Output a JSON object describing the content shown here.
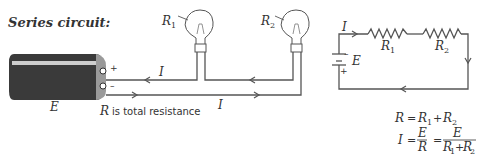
{
  "title": "Series circuit:",
  "pictorial": {
    "battery_label": "E",
    "plus_sign": "+",
    "minus_sign": "–",
    "current_top": "I",
    "current_bottom": "I",
    "bulb1": {
      "label": "R",
      "sub": "1"
    },
    "bulb2": {
      "label": "R",
      "sub": "2"
    },
    "caption_var": "R",
    "caption_text": "is total resistance"
  },
  "schematic": {
    "current_label": "I",
    "emf_label": "E",
    "minus_sign": "–",
    "plus_sign": "+",
    "resistor1": {
      "label": "R",
      "sub": "1"
    },
    "resistor2": {
      "label": "R",
      "sub": "2"
    }
  },
  "equations": {
    "eq1": {
      "lhs": "R",
      "eq": "=",
      "t1": "R",
      "s1": "1",
      "plus": "+",
      "t2": "R",
      "s2": "2"
    },
    "eq2": {
      "lhs": "I",
      "eq": "=",
      "num1": "E",
      "den1": "R",
      "eq2": "=",
      "num2": "E",
      "den_a": "R",
      "den_as": "1",
      "den_plus": "+",
      "den_b": "R",
      "den_bs": "2"
    }
  },
  "colors": {
    "ink": "#333333",
    "wire": "#555555",
    "battery_body": "#3a3a3a",
    "battery_cap": "#9a9a9a"
  }
}
